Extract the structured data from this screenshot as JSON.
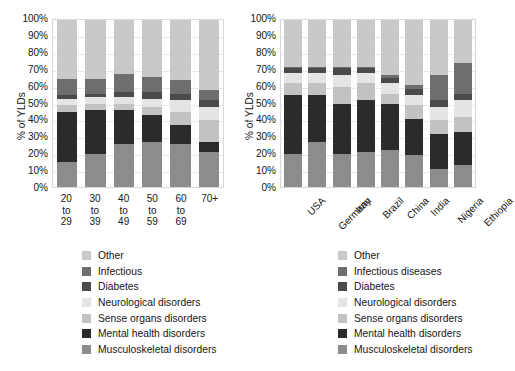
{
  "figure": {
    "background": "#ffffff",
    "panels": [
      "left-age-chart",
      "right-country-chart"
    ]
  },
  "palette": {
    "other": "#c9c9c9",
    "infectious": "#6e6e6e",
    "diabetes": "#4a4a4a",
    "neurological": "#e4e4e4",
    "sense_organs": "#c2c2c2",
    "mental_health": "#2b2b2b",
    "musculoskeletal": "#8c8c8c"
  },
  "left_panel": {
    "ylabel": "% of YLDs",
    "yticks": [
      "100%",
      "90%",
      "80%",
      "70%",
      "60%",
      "50%",
      "40%",
      "30%",
      "20%",
      "10%",
      "0%"
    ],
    "categories": [
      "20\nto\n29",
      "30\nto\n39",
      "40\nto\n49",
      "50\nto\n59",
      "60\nto\n69",
      "70+"
    ],
    "legend": [
      "Other",
      "Infectious",
      "Diabetes",
      "Neurological disorders",
      "Sense organs disorders",
      "Mental health disorders",
      "Musculoskeletal disorders"
    ]
  },
  "right_panel": {
    "ylabel": "% of YLDs",
    "yticks": [
      "100%",
      "90%",
      "80%",
      "70%",
      "60%",
      "50%",
      "40%",
      "30%",
      "20%",
      "10%",
      "0%"
    ],
    "categories": [
      "USA",
      "Germany",
      "Iran",
      "Brazil",
      "China",
      "India",
      "Nigeria",
      "Ethiopia"
    ],
    "legend": [
      "Other",
      "Infectious diseases",
      "Diabetes",
      "Neurological disorders",
      "Sense organs disorders",
      "Mental health disorders",
      "Musculoskeletal disorders"
    ]
  },
  "chart_data": [
    {
      "type": "bar",
      "id": "ylds-by-age",
      "stacked": true,
      "percent": true,
      "title": "",
      "xlabel": "",
      "ylabel": "% of YLDs",
      "ylim": [
        0,
        100
      ],
      "yticks": [
        0,
        10,
        20,
        30,
        40,
        50,
        60,
        70,
        80,
        90,
        100
      ],
      "grid": true,
      "legend_position": "below",
      "categories": [
        "20 to 29",
        "30 to 39",
        "40 to 49",
        "50 to 59",
        "60 to 69",
        "70+"
      ],
      "series": [
        {
          "name": "Musculoskeletal disorders",
          "color": "#8c8c8c",
          "values": [
            15,
            20,
            26,
            27,
            26,
            21
          ]
        },
        {
          "name": "Mental health disorders",
          "color": "#2b2b2b",
          "values": [
            30,
            26,
            20,
            16,
            11,
            6
          ]
        },
        {
          "name": "Sense organs disorders",
          "color": "#c2c2c2",
          "values": [
            4,
            4,
            4,
            5,
            8,
            13
          ]
        },
        {
          "name": "Neurological disorders",
          "color": "#e4e4e4",
          "values": [
            4,
            4,
            4,
            5,
            7,
            8
          ]
        },
        {
          "name": "Diabetes",
          "color": "#4a4a4a",
          "values": [
            2,
            2,
            3,
            4,
            4,
            4
          ]
        },
        {
          "name": "Infectious",
          "color": "#6e6e6e",
          "values": [
            10,
            9,
            11,
            9,
            8,
            6
          ]
        },
        {
          "name": "Other",
          "color": "#c9c9c9",
          "values": [
            35,
            35,
            32,
            34,
            36,
            42
          ]
        }
      ]
    },
    {
      "type": "bar",
      "id": "ylds-by-country",
      "stacked": true,
      "percent": true,
      "title": "",
      "xlabel": "",
      "ylabel": "% of YLDs",
      "ylim": [
        0,
        100
      ],
      "yticks": [
        0,
        10,
        20,
        30,
        40,
        50,
        60,
        70,
        80,
        90,
        100
      ],
      "grid": true,
      "legend_position": "below",
      "categories": [
        "USA",
        "Germany",
        "Iran",
        "Brazil",
        "China",
        "India",
        "Nigeria",
        "Ethiopia"
      ],
      "series": [
        {
          "name": "Musculoskeletal disorders",
          "color": "#8c8c8c",
          "values": [
            20,
            27,
            20,
            21,
            22,
            19,
            11,
            13
          ]
        },
        {
          "name": "Mental health disorders",
          "color": "#2b2b2b",
          "values": [
            35,
            28,
            30,
            31,
            28,
            22,
            21,
            20
          ]
        },
        {
          "name": "Sense organs disorders",
          "color": "#c2c2c2",
          "values": [
            7,
            7,
            10,
            10,
            6,
            8,
            8,
            9
          ]
        },
        {
          "name": "Neurological disorders",
          "color": "#e4e4e4",
          "values": [
            6,
            6,
            7,
            6,
            6,
            6,
            8,
            10
          ]
        },
        {
          "name": "Diabetes",
          "color": "#4a4a4a",
          "values": [
            3,
            3,
            4,
            3,
            3,
            4,
            4,
            4
          ]
        },
        {
          "name": "Infectious diseases",
          "color": "#6e6e6e",
          "values": [
            1,
            1,
            1,
            1,
            2,
            2,
            15,
            18
          ]
        },
        {
          "name": "Other",
          "color": "#c9c9c9",
          "values": [
            28,
            28,
            28,
            28,
            33,
            39,
            33,
            26
          ]
        }
      ]
    }
  ]
}
